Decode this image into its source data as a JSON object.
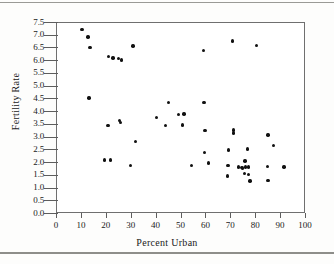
{
  "chart_data": {
    "type": "scatter",
    "title": "",
    "xlabel": "Percent Urban",
    "ylabel": "Fertility Rate",
    "xlim": [
      0,
      100
    ],
    "ylim": [
      0.0,
      7.5
    ],
    "xticks": [
      "0",
      "10",
      "20",
      "30",
      "40",
      "50",
      "60",
      "70",
      "80",
      "90",
      "100"
    ],
    "yticks": [
      "0.0",
      "0.5",
      "1.0",
      "1.5",
      "2.0",
      "2.5",
      "3.0",
      "3.5",
      "4.0",
      "4.5",
      "5.0",
      "5.5",
      "6.0",
      "6.5",
      "7.0",
      "7.5"
    ],
    "grid": false,
    "legend": null,
    "marker": {
      "shape": "circle",
      "color": "#111111",
      "size": 3.4
    },
    "points": [
      {
        "x": 10.0,
        "y": 7.25
      },
      {
        "x": 12.5,
        "y": 6.95
      },
      {
        "x": 13.3,
        "y": 6.55
      },
      {
        "x": 20.8,
        "y": 6.18
      },
      {
        "x": 22.5,
        "y": 6.12
      },
      {
        "x": 24.6,
        "y": 6.1
      },
      {
        "x": 25.8,
        "y": 6.05
      },
      {
        "x": 30.5,
        "y": 6.6
      },
      {
        "x": 12.8,
        "y": 4.55
      },
      {
        "x": 20.5,
        "y": 3.48
      },
      {
        "x": 25.0,
        "y": 3.68
      },
      {
        "x": 25.4,
        "y": 3.6
      },
      {
        "x": 31.5,
        "y": 2.85
      },
      {
        "x": 19.0,
        "y": 2.12
      },
      {
        "x": 21.5,
        "y": 2.12
      },
      {
        "x": 29.5,
        "y": 1.9
      },
      {
        "x": 40.0,
        "y": 3.8
      },
      {
        "x": 43.5,
        "y": 3.48
      },
      {
        "x": 44.8,
        "y": 4.38
      },
      {
        "x": 48.8,
        "y": 3.9
      },
      {
        "x": 51.0,
        "y": 3.92
      },
      {
        "x": 50.5,
        "y": 3.5
      },
      {
        "x": 54.0,
        "y": 1.9
      },
      {
        "x": 58.8,
        "y": 6.42
      },
      {
        "x": 59.0,
        "y": 4.37
      },
      {
        "x": 59.5,
        "y": 3.28
      },
      {
        "x": 59.2,
        "y": 2.42
      },
      {
        "x": 60.8,
        "y": 2.0
      },
      {
        "x": 68.8,
        "y": 2.52
      },
      {
        "x": 68.6,
        "y": 1.9
      },
      {
        "x": 68.5,
        "y": 1.5
      },
      {
        "x": 70.5,
        "y": 6.8
      },
      {
        "x": 70.8,
        "y": 3.3
      },
      {
        "x": 71.0,
        "y": 3.18
      },
      {
        "x": 73.0,
        "y": 1.85
      },
      {
        "x": 74.0,
        "y": 1.82
      },
      {
        "x": 74.5,
        "y": 1.8
      },
      {
        "x": 75.5,
        "y": 2.08
      },
      {
        "x": 75.8,
        "y": 1.85
      },
      {
        "x": 75.2,
        "y": 1.6
      },
      {
        "x": 76.5,
        "y": 2.55
      },
      {
        "x": 76.8,
        "y": 1.85
      },
      {
        "x": 77.0,
        "y": 1.55
      },
      {
        "x": 77.5,
        "y": 1.3
      },
      {
        "x": 80.2,
        "y": 6.62
      },
      {
        "x": 84.8,
        "y": 3.1
      },
      {
        "x": 87.0,
        "y": 2.7
      },
      {
        "x": 84.5,
        "y": 1.87
      },
      {
        "x": 84.8,
        "y": 1.32
      },
      {
        "x": 91.2,
        "y": 1.85
      }
    ]
  }
}
